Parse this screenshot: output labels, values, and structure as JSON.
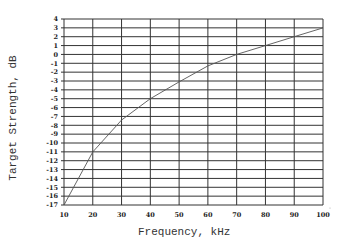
{
  "chart_data": {
    "type": "line",
    "title": "",
    "xlabel": "Frequency, kHz",
    "ylabel": "Target Strength, dB",
    "xlim": [
      10,
      100
    ],
    "ylim": [
      -17,
      4
    ],
    "grid": true,
    "legend": null,
    "x_ticks": [
      10,
      20,
      30,
      40,
      50,
      60,
      70,
      80,
      90,
      100
    ],
    "y_ticks": [
      4,
      3,
      2,
      1,
      0,
      -1,
      -2,
      -3,
      -4,
      -5,
      -6,
      -7,
      -8,
      -9,
      -10,
      -11,
      -12,
      -13,
      -14,
      -15,
      -16,
      -17
    ],
    "series": [
      {
        "name": "Target Strength",
        "x": [
          10,
          20,
          30,
          40,
          50,
          60,
          70,
          80,
          90,
          100
        ],
        "values": [
          -17,
          -11,
          -7.4,
          -5.0,
          -3.1,
          -1.3,
          0.0,
          1.0,
          2.0,
          3.0
        ]
      }
    ],
    "colors": {
      "line": "#555555",
      "grid": "#333333",
      "text": "#222222"
    }
  }
}
